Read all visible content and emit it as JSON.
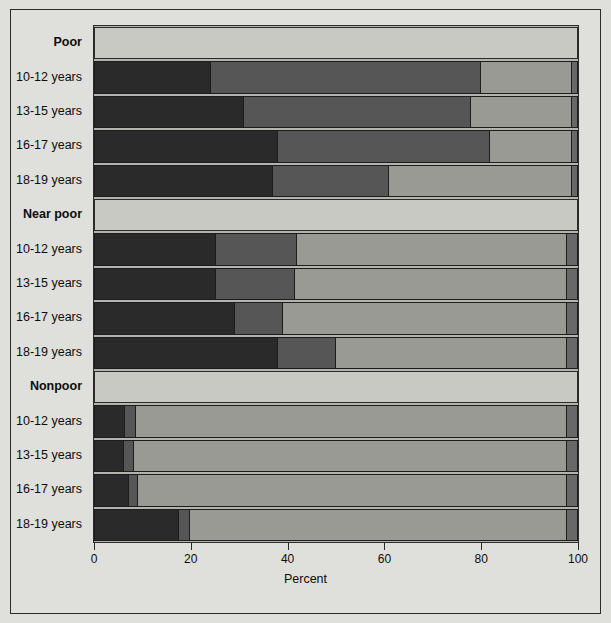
{
  "chart_data": {
    "type": "bar",
    "orientation": "horizontal",
    "stacked": true,
    "title": "",
    "xlabel": "Percent",
    "ylabel": "",
    "xlim": [
      0,
      100
    ],
    "xticks": [
      0,
      20,
      40,
      60,
      80,
      100
    ],
    "xtick_labels": [
      "0",
      "20",
      "40",
      "60",
      "80",
      "100"
    ],
    "grid": false,
    "legend_position": "top",
    "series": [
      {
        "name": "Uninsured",
        "color": "#2a2a2a",
        "values": [
          24.0,
          31.0,
          38.0,
          37.0,
          25.0,
          25.0,
          29.0,
          38.0,
          6.3,
          6.0,
          7.0,
          17.5
        ]
      },
      {
        "name": "Medicaid",
        "color": "#565656",
        "values": [
          56.0,
          47.0,
          44.0,
          24.0,
          17.0,
          16.5,
          10.0,
          12.0,
          2.3,
          2.0,
          2.0,
          2.2
        ]
      },
      {
        "name": "Private",
        "color": "#9a9a94",
        "values": [
          19.0,
          21.0,
          17.0,
          38.0,
          56.0,
          56.5,
          59.0,
          48.0,
          89.4,
          90.0,
          89.0,
          78.3
        ]
      },
      {
        "name": "Other",
        "color": "#686868",
        "values": [
          1.0,
          1.0,
          1.0,
          1.0,
          2.0,
          2.0,
          2.0,
          2.0,
          2.0,
          2.0,
          2.0,
          2.0
        ]
      }
    ],
    "groups": [
      {
        "label": "Poor",
        "categories": [
          "10-12 years",
          "13-15 years",
          "16-17 years",
          "18-19 years"
        ]
      },
      {
        "label": "Near poor",
        "categories": [
          "10-12 years",
          "13-15 years",
          "16-17 years",
          "18-19 years"
        ]
      },
      {
        "label": "Nonpoor",
        "categories": [
          "10-12 years",
          "13-15 years",
          "16-17 years",
          "18-19 years"
        ]
      }
    ],
    "categories": [
      "Poor 10-12 years",
      "Poor 13-15 years",
      "Poor 16-17 years",
      "Poor 18-19 years",
      "Near poor 10-12 years",
      "Near poor 13-15 years",
      "Near poor 16-17 years",
      "Near poor 18-19 years",
      "Nonpoor 10-12 years",
      "Nonpoor 13-15 years",
      "Nonpoor 16-17 years",
      "Nonpoor 18-19 years"
    ]
  },
  "legend": {
    "items": [
      {
        "label": "Uninsured",
        "color": "#2a2a2a"
      },
      {
        "label": "Medicaid",
        "color": "#565656"
      },
      {
        "label": "Private",
        "color": "#9a9a94"
      },
      {
        "label": "Other",
        "color": "#686868"
      }
    ]
  },
  "axis": {
    "x_title": "Percent",
    "x_tick_labels": [
      "0",
      "20",
      "40",
      "60",
      "80",
      "100"
    ]
  },
  "y_rows": [
    {
      "label": "Poor",
      "type": "group"
    },
    {
      "label": "10-12 years",
      "type": "bar"
    },
    {
      "label": "13-15 years",
      "type": "bar"
    },
    {
      "label": "16-17 years",
      "type": "bar"
    },
    {
      "label": "18-19 years",
      "type": "bar"
    },
    {
      "label": "Near poor",
      "type": "group"
    },
    {
      "label": "10-12 years",
      "type": "bar"
    },
    {
      "label": "13-15 years",
      "type": "bar"
    },
    {
      "label": "16-17 years",
      "type": "bar"
    },
    {
      "label": "18-19 years",
      "type": "bar"
    },
    {
      "label": "Nonpoor",
      "type": "group"
    },
    {
      "label": "10-12 years",
      "type": "bar"
    },
    {
      "label": "13-15 years",
      "type": "bar"
    },
    {
      "label": "16-17 years",
      "type": "bar"
    },
    {
      "label": "18-19 years",
      "type": "bar"
    }
  ],
  "colors": {
    "page_background": "#dfdfdb",
    "plot_background": "#b4b4ae",
    "band_background": "#c9c9c4",
    "frame": "#2b2b2b",
    "text": "#0d0d0d"
  }
}
